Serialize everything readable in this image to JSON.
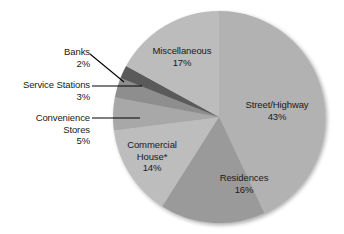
{
  "chart_data": {
    "type": "pie",
    "title": "",
    "subtitle": "",
    "xlabel": "",
    "ylabel": "",
    "legend_position": "none",
    "grid": false,
    "units": "percent",
    "start_angle_deg": 0,
    "direction": "clockwise",
    "total": 100,
    "footnote": "*",
    "categories": [
      "Street/Highway",
      "Residences",
      "Commercial House*",
      "Convenience Stores",
      "Service Stations",
      "Banks",
      "Miscellaneous"
    ],
    "values": [
      43,
      16,
      14,
      5,
      3,
      2,
      17
    ],
    "slices": [
      {
        "label": "Street/Highway",
        "label_line1": "Street/Highway",
        "value": 43,
        "value_text": "43%",
        "color": "#b2b2b2",
        "start_deg": 0,
        "end_deg": 154.8,
        "label_placement": "inside"
      },
      {
        "label": "Residences",
        "label_line1": "Residences",
        "value": 16,
        "value_text": "16%",
        "color": "#9a9a9a",
        "start_deg": 154.8,
        "end_deg": 212.4,
        "label_placement": "inside"
      },
      {
        "label": "Commercial House*",
        "label_line1": "Commercial",
        "label_line2": "House*",
        "value": 14,
        "value_text": "14%",
        "color": "#bdbdbd",
        "start_deg": 212.4,
        "end_deg": 262.8,
        "label_placement": "inside"
      },
      {
        "label": "Convenience Stores",
        "label_line1": "Convenience",
        "label_line2": "Stores",
        "value": 5,
        "value_text": "5%",
        "color": "#a8a8a8",
        "start_deg": 262.8,
        "end_deg": 280.8,
        "label_placement": "outside-left",
        "leader": true
      },
      {
        "label": "Service Stations",
        "label_line1": "Service Stations",
        "value": 3,
        "value_text": "3%",
        "color": "#8e8e8e",
        "start_deg": 280.8,
        "end_deg": 291.6,
        "label_placement": "outside-left",
        "leader": true
      },
      {
        "label": "Banks",
        "label_line1": "Banks",
        "value": 2,
        "value_text": "2%",
        "color": "#5a5a5a",
        "start_deg": 291.6,
        "end_deg": 298.8,
        "label_placement": "outside-left",
        "leader": true
      },
      {
        "label": "Miscellaneous",
        "label_line1": "Miscellaneous",
        "value": 17,
        "value_text": "17%",
        "color": "#bcbcbc",
        "start_deg": 298.8,
        "end_deg": 360,
        "label_placement": "inside"
      }
    ]
  },
  "labels": {
    "banks": {
      "name": "Banks",
      "percent": "2%"
    },
    "service_stations": {
      "name": "Service Stations",
      "percent": "3%"
    },
    "convenience_stores": {
      "name_line1": "Convenience",
      "name_line2": "Stores",
      "percent": "5%"
    },
    "miscellaneous": {
      "name": "Miscellaneous",
      "percent": "17%"
    },
    "street_highway": {
      "name": "Street/Highway",
      "percent": "43%"
    },
    "residences": {
      "name": "Residences",
      "percent": "16%"
    },
    "commercial_house": {
      "name_line1": "Commercial",
      "name_line2": "House*",
      "percent": "14%"
    }
  },
  "colors": {
    "background": "#ffffff",
    "text": "#1a1a1a",
    "leader_line": "#000000",
    "slice_street_highway": "#b2b2b2",
    "slice_residences": "#9a9a9a",
    "slice_commercial_house": "#bdbdbd",
    "slice_convenience_stores": "#a8a8a8",
    "slice_service_stations": "#8e8e8e",
    "slice_banks": "#5a5a5a",
    "slice_miscellaneous": "#bcbcbc"
  }
}
